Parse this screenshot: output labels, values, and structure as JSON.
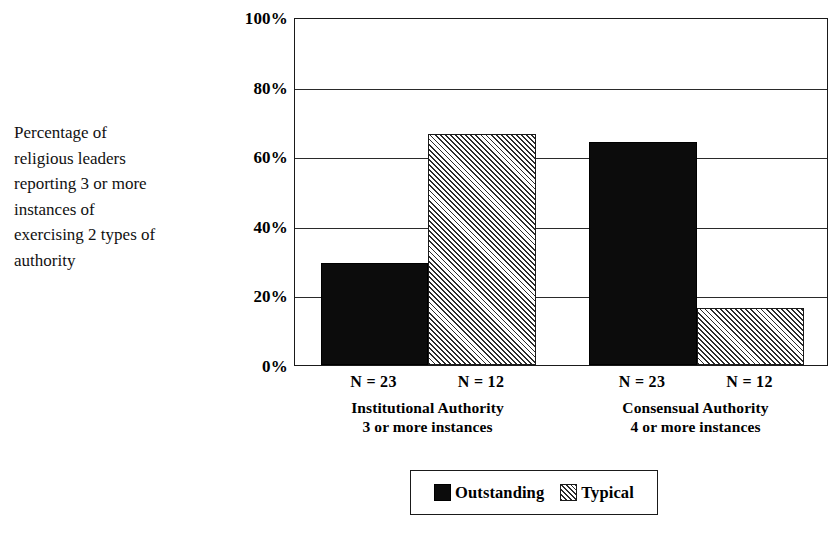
{
  "caption": {
    "text": "Percentage of\nreligious leaders\nreporting 3 or more\ninstances of\nexercising 2 types of\nauthority"
  },
  "chart_data": {
    "type": "bar",
    "title": "",
    "subtitle": "",
    "xlabel": "",
    "ylabel": "Percentage of religious leaders reporting 3 or more instances of exercising 2 types of authority",
    "ylim": [
      0,
      100
    ],
    "yticks": [
      "0%",
      "20%",
      "40%",
      "60%",
      "80%",
      "100%"
    ],
    "ytick_values": [
      0,
      20,
      40,
      60,
      80,
      100
    ],
    "grid": true,
    "legend_position": "bottom-center",
    "categories": [
      "Institutional Authority",
      "Consensual Authority"
    ],
    "category_sublabels": [
      "3 or more instances",
      "4 or more instances"
    ],
    "series": [
      {
        "name": "Outstanding",
        "fill": "solid-black",
        "values": [
          29.4,
          64.5
        ],
        "n_labels": [
          "N = 23",
          "N = 23"
        ]
      },
      {
        "name": "Typical",
        "fill": "diagonal-hatch",
        "values": [
          66.7,
          16.5
        ],
        "n_labels": [
          "N = 12",
          "N = 12"
        ]
      }
    ],
    "bars": [
      {
        "group": "Institutional Authority",
        "series": "Outstanding",
        "value": 29.4,
        "n_label": "N = 23",
        "fill": "solid-black"
      },
      {
        "group": "Institutional Authority",
        "series": "Typical",
        "value": 66.7,
        "n_label": "N = 12",
        "fill": "diagonal-hatch"
      },
      {
        "group": "Consensual Authority",
        "series": "Outstanding",
        "value": 64.5,
        "n_label": "N = 23",
        "fill": "solid-black"
      },
      {
        "group": "Consensual Authority",
        "series": "Typical",
        "value": 16.5,
        "n_label": "N = 12",
        "fill": "diagonal-hatch"
      }
    ],
    "colors": {
      "outstanding": "#0c0c0c",
      "typical_hatch": "#2b2b2b",
      "background": "#ffffff",
      "axis": "#1a1a1a",
      "gridline": "#2a2a2a"
    }
  },
  "legend": {
    "entries": [
      {
        "label": "Outstanding",
        "fill": "solid-black"
      },
      {
        "label": "Typical",
        "fill": "diagonal-hatch"
      }
    ]
  }
}
